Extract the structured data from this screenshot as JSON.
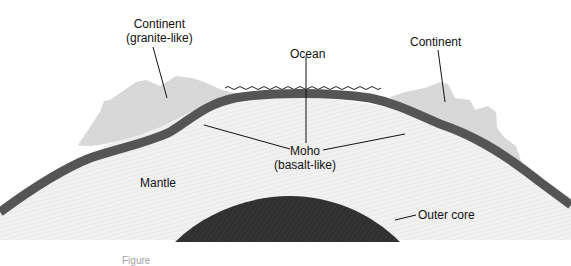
{
  "diagram": {
    "type": "earth-cross-section",
    "labels": {
      "continent_left_line1": "Continent",
      "continent_left_line2": "(granite-like)",
      "ocean": "Ocean",
      "continent_right": "Continent",
      "moho_line1": "Moho",
      "moho_line2": "(basalt-like)",
      "mantle": "Mantle",
      "outer_core": "Outer core"
    },
    "caption": "Figure",
    "colors": {
      "background": "#ffffff",
      "continent": "#d9d9d9",
      "crust_band": "#5a5a5a",
      "mantle": "#efefef",
      "outer_core": "#2e2e2e",
      "lines": "#111111"
    }
  }
}
